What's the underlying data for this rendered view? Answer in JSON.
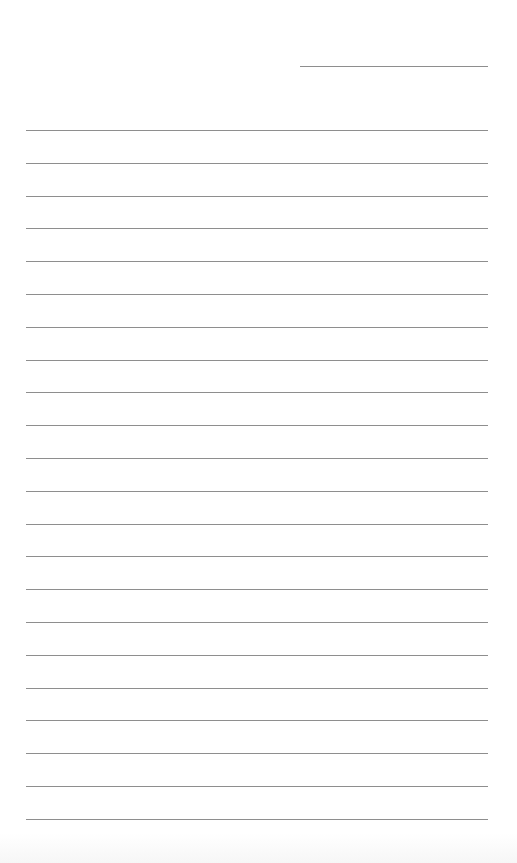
{
  "page": {
    "type": "lined-paper",
    "background": "#ffffff",
    "line_color": "#8e8e8e"
  },
  "header_line": {
    "x": 300,
    "y": 66,
    "width": 188
  },
  "rules": {
    "count": 22,
    "x": 26,
    "width": 462,
    "first_y": 130,
    "spacing": 32.8
  }
}
